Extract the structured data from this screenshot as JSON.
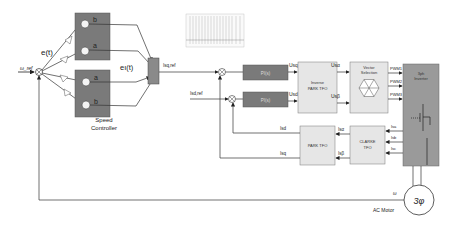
{
  "diagram": {
    "inputs": {
      "speed_ref": "ω_ref",
      "speed_feedback": "ω"
    },
    "speed_controller": {
      "label_line1": "Speed",
      "label_line2": "Controller",
      "error_label": "e(t)",
      "error_integral_label": "eı(t)",
      "top_unit": {
        "nodes": [
          "b",
          "a"
        ]
      },
      "bottom_unit": {
        "nodes": [
          "a",
          "b"
        ]
      }
    },
    "signals": {
      "isq_ref": "Isq,ref",
      "isd_ref": "Isd,ref",
      "usq": "Usq",
      "usd": "Usd",
      "us_alpha": "Usα",
      "us_beta": "Usβ",
      "pwm1": "PWM1",
      "pwm2": "PWM2",
      "pwm3": "PWM3",
      "isa": "Isa",
      "isb": "Isb",
      "isc": "Isc",
      "is_alpha": "Isα",
      "is_beta": "Isβ",
      "isd": "Isd",
      "isq": "Isq",
      "omega": "ω"
    },
    "blocks": {
      "pi_top": "PI(s)",
      "pi_bottom": "PI(s)",
      "inverse_park_line1": "Inverse",
      "inverse_park_line2": "PARK TFO",
      "vector_selection_line1": "Vector",
      "vector_selection_line2": "Selection",
      "inverter_line1": "3ph",
      "inverter_line2": "Inverter",
      "park": "PARK TFO",
      "clarke_line1": "CLARKE",
      "clarke_line2": "TFO",
      "motor_symbol": "3φ",
      "motor_label": "AC Motor"
    },
    "colors": {
      "dark_block": "#7a7a7a",
      "light_block": "#e6e6e6",
      "inverter": "#9a9a9a",
      "line": "#333333"
    }
  }
}
